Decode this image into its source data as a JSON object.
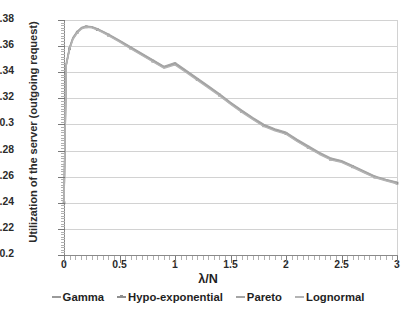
{
  "chart_data": {
    "type": "line",
    "title": "",
    "xlabel": "λ/N",
    "ylabel": "Utilization of the server (outgoing request)",
    "xlim": [
      0,
      3
    ],
    "ylim": [
      0.2,
      0.38
    ],
    "grid": "horizontal",
    "legend_position": "bottom",
    "xticks": [
      "0",
      "0.5",
      "1",
      "1.5",
      "2",
      "2.5",
      "3"
    ],
    "xtick_values": [
      0,
      0.5,
      1,
      1.5,
      2,
      2.5,
      3
    ],
    "yticks": [
      "0.2",
      "0.22",
      "0.24",
      "0.26",
      "0.28",
      "0.3",
      "0.32",
      "0.34",
      "0.36",
      "0.38"
    ],
    "ytick_values": [
      0.2,
      0.22,
      0.24,
      0.26,
      0.28,
      0.3,
      0.32,
      0.34,
      0.36,
      0.38
    ],
    "x": [
      0,
      0.02,
      0.05,
      0.08,
      0.12,
      0.16,
      0.2,
      0.25,
      0.3,
      0.35,
      0.4,
      0.5,
      0.6,
      0.7,
      0.8,
      0.9,
      1.0,
      1.1,
      1.2,
      1.3,
      1.4,
      1.5,
      1.6,
      1.7,
      1.8,
      1.9,
      2.0,
      2.1,
      2.2,
      2.3,
      2.4,
      2.5,
      2.6,
      2.7,
      2.8,
      2.9,
      3.0
    ],
    "series": [
      {
        "name": "Gamma",
        "color": "#9a9a9a",
        "marker": "dash",
        "values": [
          0.24,
          0.346,
          0.3585,
          0.366,
          0.371,
          0.374,
          0.375,
          0.3746,
          0.373,
          0.371,
          0.3688,
          0.364,
          0.359,
          0.354,
          0.349,
          0.344,
          0.3468,
          0.341,
          0.335,
          0.329,
          0.323,
          0.3165,
          0.3105,
          0.3048,
          0.2995,
          0.2962,
          0.2935,
          0.288,
          0.283,
          0.278,
          0.2738,
          0.2718,
          0.268,
          0.264,
          0.26,
          0.2575,
          0.2553
        ]
      },
      {
        "name": "Hypo-exponential",
        "color": "#8f8f8f",
        "marker": "square",
        "values": [
          0.24,
          0.3455,
          0.358,
          0.3656,
          0.3706,
          0.3737,
          0.3748,
          0.3744,
          0.3727,
          0.3707,
          0.3684,
          0.3636,
          0.3585,
          0.3535,
          0.3485,
          0.3435,
          0.3462,
          0.3404,
          0.3345,
          0.3285,
          0.3225,
          0.316,
          0.31,
          0.3043,
          0.299,
          0.2957,
          0.293,
          0.2875,
          0.2825,
          0.2776,
          0.2734,
          0.2714,
          0.2676,
          0.2636,
          0.2597,
          0.2572,
          0.255
        ]
      },
      {
        "name": "Pareto",
        "color": "#a5a5a5",
        "marker": "dash",
        "values": [
          0.24,
          0.3465,
          0.359,
          0.3664,
          0.3714,
          0.3743,
          0.3753,
          0.3749,
          0.3733,
          0.3713,
          0.3691,
          0.3644,
          0.3594,
          0.3544,
          0.3494,
          0.3444,
          0.3473,
          0.3415,
          0.3355,
          0.3295,
          0.3234,
          0.317,
          0.311,
          0.3053,
          0.3,
          0.2966,
          0.294,
          0.2885,
          0.2835,
          0.2785,
          0.2743,
          0.2723,
          0.2684,
          0.2644,
          0.2604,
          0.2579,
          0.2557
        ]
      },
      {
        "name": "Lognormal",
        "color": "#b4b4b4",
        "marker": "line",
        "values": [
          0.24,
          0.345,
          0.3575,
          0.3651,
          0.3702,
          0.3733,
          0.3744,
          0.374,
          0.3724,
          0.3703,
          0.368,
          0.3632,
          0.3581,
          0.3531,
          0.3481,
          0.3431,
          0.3457,
          0.3399,
          0.334,
          0.328,
          0.322,
          0.3155,
          0.3095,
          0.3038,
          0.2985,
          0.2952,
          0.2926,
          0.2871,
          0.2821,
          0.2772,
          0.273,
          0.271,
          0.2672,
          0.2632,
          0.2593,
          0.2568,
          0.2546
        ]
      }
    ]
  },
  "legend": {
    "items": [
      {
        "label": "Gamma"
      },
      {
        "label": "Hypo-exponential"
      },
      {
        "label": "Pareto"
      },
      {
        "label": "Lognormal"
      }
    ]
  }
}
